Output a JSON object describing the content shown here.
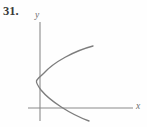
{
  "figure": {
    "problem_number": "31.",
    "background_color": "#fefefe",
    "axis_color": "#8a8a8a",
    "curve_color": "#7d7d7d",
    "label_color": "#6e6e6e",
    "number_color": "#3a3a3a"
  },
  "axes": {
    "y_label": "y",
    "x_label": "x",
    "origin": {
      "x": 40,
      "y": 108
    },
    "x_axis": {
      "x_start": 28,
      "x_end": 133,
      "y": 108
    },
    "y_axis": {
      "x": 40,
      "y_start": 22,
      "y_end": 121
    },
    "show_ticks": false,
    "show_grid": false,
    "tick_labels_x": [],
    "tick_labels_y": []
  },
  "chart_data": {
    "type": "line",
    "title": "",
    "xlabel": "x",
    "ylabel": "y",
    "curves": [
      {
        "name": "parabola",
        "vertex": {
          "x": 36.5,
          "y": 81
        },
        "opens": "right",
        "path": "M 93 46 C 74 51, 54 62, 44 73 C 40 77, 37 79, 36.5 81 C 36 83, 38 86, 41 90 C 50 101, 70 114, 89 121",
        "x_axis_crossing": {
          "x": 58,
          "y": 108
        },
        "upper_endpoint": {
          "x": 93,
          "y": 46
        },
        "lower_endpoint": {
          "x": 89,
          "y": 121
        }
      }
    ]
  }
}
